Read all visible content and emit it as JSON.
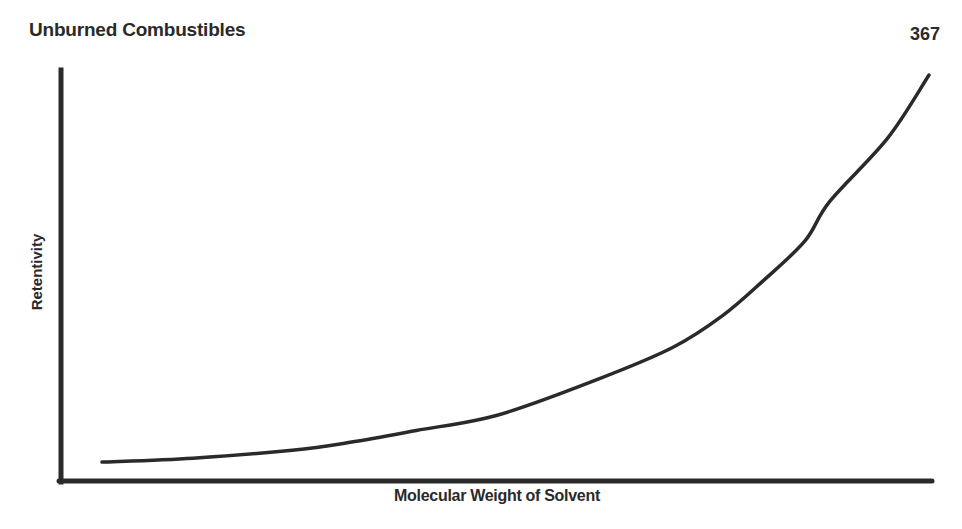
{
  "header": {
    "section_title": "Unburned Combustibles",
    "page_number": "367"
  },
  "chart_data": {
    "type": "line",
    "title": "",
    "xlabel": "Molecular Weight of Solvent",
    "ylabel": "Retentivity",
    "xticks": [],
    "yticks": [],
    "grid": false,
    "legend": null,
    "series": [
      {
        "name": "Retentivity vs Molecular Weight",
        "x": [
          0.0,
          0.11,
          0.23,
          0.3,
          0.38,
          0.48,
          0.6,
          0.69,
          0.75,
          0.8,
          0.85,
          0.88,
          0.95,
          1.0
        ],
        "y": [
          0.02,
          0.03,
          0.05,
          0.07,
          0.1,
          0.14,
          0.23,
          0.31,
          0.39,
          0.48,
          0.58,
          0.68,
          0.84,
          1.0
        ]
      }
    ],
    "xlim": [
      0,
      1
    ],
    "ylim": [
      0,
      1
    ]
  },
  "colors": {
    "ink": "#2a2a2a",
    "background": "#ffffff"
  }
}
